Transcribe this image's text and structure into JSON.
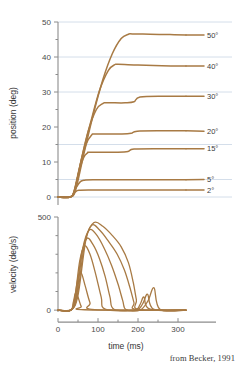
{
  "figure": {
    "credit": "from Becker, 1991"
  },
  "chart_data": [
    {
      "type": "line",
      "id": "position-panel",
      "title": "",
      "xlabel": "",
      "ylabel": "position (deg)",
      "xlim": [
        0,
        320
      ],
      "ylim": [
        -2,
        50
      ],
      "xticks": [
        0,
        50,
        100,
        150,
        200,
        250,
        300
      ],
      "xtick_labels": [
        "",
        "",
        "",
        "",
        "",
        "",
        ""
      ],
      "yticks": [
        0,
        5,
        10,
        15,
        20,
        25,
        30,
        35,
        40,
        45,
        50
      ],
      "ytick_labels": [
        "0",
        "",
        "10",
        "",
        "20",
        "",
        "30",
        "",
        "40",
        "",
        "50"
      ],
      "grid": true,
      "gridlines_y": [
        0,
        5,
        15,
        30,
        40,
        50
      ],
      "legend": "right-of-axis",
      "line_color": "#a87a44",
      "grid_color": "#c9d6e4",
      "axis_color": "#8c8c8c",
      "series": [
        {
          "name": "2°",
          "label": "2°",
          "target_amplitude": 2,
          "label_y": 2,
          "x": [
            0,
            30,
            38,
            44,
            52,
            80,
            140,
            200,
            320
          ],
          "values": [
            0,
            0,
            0.5,
            1.5,
            1.9,
            2.0,
            2.0,
            2.0,
            2.0
          ]
        },
        {
          "name": "5°",
          "label": "5°",
          "target_amplitude": 5,
          "label_y": 5,
          "x": [
            0,
            30,
            38,
            46,
            56,
            66,
            90,
            150,
            220,
            320
          ],
          "values": [
            0,
            0,
            0.8,
            2.8,
            4.4,
            4.8,
            4.9,
            4.9,
            4.9,
            4.9
          ]
        },
        {
          "name": "15°",
          "label": "15°",
          "target_amplitude": 15,
          "label_y": 13.8,
          "x": [
            0,
            30,
            40,
            52,
            64,
            74,
            82,
            150,
            175,
            190,
            260,
            320
          ],
          "values": [
            0,
            0,
            1.5,
            7.0,
            11.2,
            12.6,
            12.8,
            12.8,
            13.0,
            13.7,
            13.8,
            13.8
          ]
        },
        {
          "name": "20°",
          "label": "20°",
          "target_amplitude": 20,
          "label_y": 18.8,
          "x": [
            0,
            30,
            40,
            54,
            70,
            84,
            94,
            160,
            183,
            198,
            265,
            320
          ],
          "values": [
            0,
            0,
            1.6,
            8.5,
            15.0,
            17.7,
            18.0,
            18.0,
            18.2,
            18.8,
            18.9,
            18.9
          ]
        },
        {
          "name": "30°",
          "label": "30°",
          "target_amplitude": 30,
          "label_y": 28.8,
          "x": [
            0,
            30,
            42,
            58,
            76,
            96,
            112,
            122,
            168,
            190,
            205,
            270,
            320
          ],
          "values": [
            0,
            0,
            2.0,
            10.5,
            19.0,
            25.0,
            26.7,
            26.9,
            26.9,
            27.2,
            28.6,
            28.8,
            28.8
          ]
        },
        {
          "name": "40°",
          "label": "40°",
          "target_amplitude": 40,
          "label_y": 37.4,
          "x": [
            0,
            30,
            42,
            60,
            82,
            104,
            126,
            142,
            150,
            200,
            260,
            320
          ],
          "values": [
            0,
            0,
            2.0,
            11.5,
            21.5,
            30.5,
            36.2,
            37.8,
            37.9,
            37.7,
            37.5,
            37.4
          ]
        },
        {
          "name": "50°",
          "label": "50°",
          "target_amplitude": 50,
          "label_y": 46.3,
          "x": [
            0,
            30,
            44,
            64,
            88,
            112,
            136,
            158,
            176,
            186,
            230,
            280,
            320
          ],
          "values": [
            0,
            0,
            2.0,
            12.0,
            23.5,
            33.5,
            41.0,
            45.3,
            46.5,
            46.6,
            46.5,
            46.4,
            46.3
          ]
        }
      ]
    },
    {
      "type": "line",
      "id": "velocity-panel",
      "title": "",
      "xlabel": "time (ms)",
      "ylabel": "velocity (deg/s)",
      "xlim": [
        0,
        320
      ],
      "ylim": [
        -10,
        500
      ],
      "xticks": [
        0,
        50,
        100,
        150,
        200,
        250,
        300
      ],
      "xtick_labels": [
        "0",
        "",
        "100",
        "",
        "200",
        "",
        "300"
      ],
      "yticks": [
        0,
        100,
        200,
        300,
        400,
        500
      ],
      "ytick_labels": [
        "0",
        "",
        "",
        "",
        "",
        "500"
      ],
      "grid": false,
      "line_color": "#a87a44",
      "axis_color": "#8c8c8c",
      "series": [
        {
          "name": "2°",
          "peak_velocity": 95,
          "x": [
            0,
            32,
            38,
            44,
            50,
            58,
            66,
            320
          ],
          "values": [
            0,
            0,
            40,
            92,
            70,
            20,
            2,
            0
          ]
        },
        {
          "name": "5°",
          "peak_velocity": 200,
          "x": [
            0,
            32,
            40,
            50,
            58,
            68,
            80,
            92,
            320
          ],
          "values": [
            0,
            0,
            45,
            175,
            200,
            130,
            40,
            3,
            0
          ]
        },
        {
          "name": "15°",
          "peak_velocity": 345,
          "x": [
            0,
            32,
            42,
            54,
            66,
            80,
            94,
            108,
            118,
            190,
            205,
            215,
            230,
            320
          ],
          "values": [
            0,
            0,
            60,
            260,
            345,
            300,
            195,
            70,
            5,
            0,
            30,
            70,
            5,
            0
          ]
        },
        {
          "name": "20°",
          "peak_velocity": 390,
          "x": [
            0,
            32,
            44,
            58,
            72,
            88,
            104,
            118,
            130,
            140,
            195,
            212,
            224,
            240,
            320
          ],
          "values": [
            0,
            0,
            65,
            290,
            385,
            350,
            275,
            180,
            70,
            5,
            0,
            35,
            85,
            4,
            0
          ]
        },
        {
          "name": "30°",
          "peak_velocity": 430,
          "x": [
            0,
            32,
            46,
            62,
            78,
            96,
            116,
            134,
            150,
            162,
            170,
            205,
            225,
            240,
            255,
            320
          ],
          "values": [
            0,
            0,
            70,
            330,
            430,
            405,
            330,
            240,
            140,
            50,
            3,
            0,
            50,
            120,
            4,
            0
          ]
        },
        {
          "name": "40°",
          "peak_velocity": 455,
          "x": [
            0,
            32,
            48,
            66,
            84,
            104,
            126,
            148,
            166,
            180,
            190,
            196,
            320
          ],
          "values": [
            0,
            0,
            75,
            350,
            455,
            430,
            370,
            300,
            215,
            120,
            40,
            3,
            0
          ]
        },
        {
          "name": "50°",
          "peak_velocity": 470,
          "x": [
            0,
            32,
            50,
            70,
            90,
            112,
            136,
            158,
            176,
            188,
            196,
            202,
            320
          ],
          "values": [
            0,
            0,
            80,
            380,
            470,
            450,
            400,
            340,
            255,
            150,
            55,
            3,
            0
          ]
        }
      ]
    }
  ]
}
